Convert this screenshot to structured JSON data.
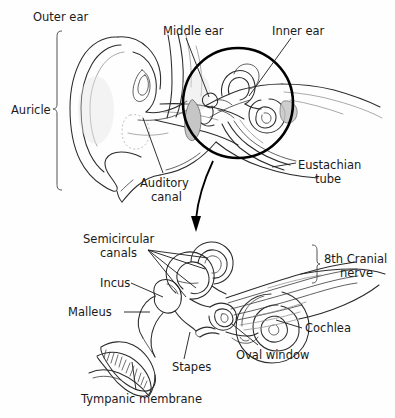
{
  "figure": {
    "background_color": "#fefefe",
    "ink_color": "#1a1a1a",
    "width": 395,
    "height": 418
  },
  "panels": {
    "upper": {
      "name": "cross-section of whole ear",
      "labels": {
        "outer_ear": "Outer ear",
        "auricle": "Auricle",
        "middle_ear": "Middle ear",
        "inner_ear": "Inner ear",
        "auditory_canal_line1": "Auditory",
        "auditory_canal_line2": "canal",
        "eustachian_line1": "Eustachian",
        "eustachian_line2": "tube"
      }
    },
    "lower": {
      "name": "magnified middle and inner ear",
      "labels": {
        "semicircular_line1": "Semicircular",
        "semicircular_line2": "canals",
        "incus": "Incus",
        "malleus": "Malleus",
        "stapes": "Stapes",
        "tympanic_membrane": "Tympanic membrane",
        "oval_window": "Oval window",
        "cochlea": "Cochlea",
        "cranial_nerve_line1": "8th Cranial",
        "cranial_nerve_line2": "nerve"
      }
    }
  },
  "annotations": {
    "magnify_circle": "circle highlighting middle and inner ear",
    "magnify_arrow": "curved arrow pointing to enlarged view"
  }
}
